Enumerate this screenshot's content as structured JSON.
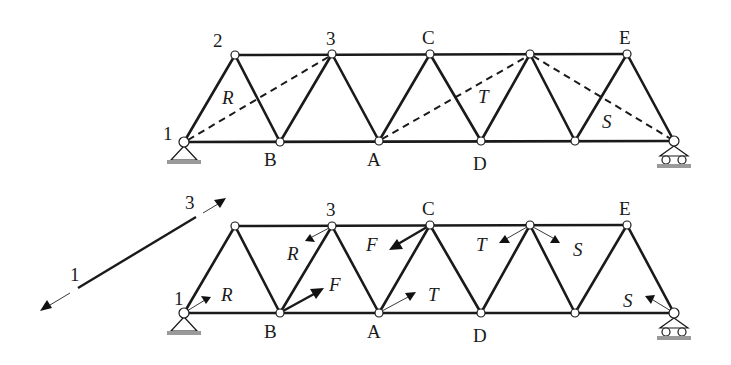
{
  "figure": {
    "top_truss": {
      "node_labels": {
        "n1": "1",
        "n2": "2",
        "n3": "3",
        "nC": "C",
        "nE": "E",
        "nB": "B",
        "nA": "A",
        "nD": "D"
      },
      "section_labels": {
        "R": "R",
        "T": "T",
        "S": "S"
      }
    },
    "bottom_truss": {
      "node_labels": {
        "n1": "1",
        "n3": "3",
        "nC": "C",
        "nE": "E",
        "nB": "B",
        "nA": "A",
        "nD": "D"
      },
      "force_labels": {
        "R_at_1": "R",
        "R_at_3": "R",
        "F_at_B": "F",
        "F_at_C": "F",
        "T_at_A": "T",
        "T_at_top4": "T",
        "S_at_top4": "S",
        "S_at_support": "S"
      }
    },
    "side_line": {
      "label_start": "1",
      "label_end": "3"
    }
  }
}
